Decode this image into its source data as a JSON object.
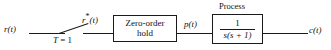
{
  "diagram": {
    "type": "control-system-block-diagram",
    "input_signal": "r(t)",
    "sampled_signal_base": "r",
    "sampled_signal_star": "*",
    "sampled_signal_arg": "(t)",
    "sampling_period": "T = 1",
    "sampling_period_var": "T",
    "sampling_period_value": "= 1",
    "hold_block_line1": "Zero-order",
    "hold_block_line2": "hold",
    "hold_output_signal": "p(t)",
    "process_caption": "Process",
    "process_numerator": "1",
    "process_denominator_full": "s(s + 1)",
    "process_denominator_s1": "s",
    "process_denominator_paren_open": "(",
    "process_denominator_s2": "s",
    "process_denominator_plus": " + ",
    "process_denominator_one": "1",
    "process_denominator_paren_close": ")",
    "output_signal": "c(t)",
    "line_color": "#1a1a1a",
    "background_color": "#ffffff",
    "text_color": "#111111"
  }
}
